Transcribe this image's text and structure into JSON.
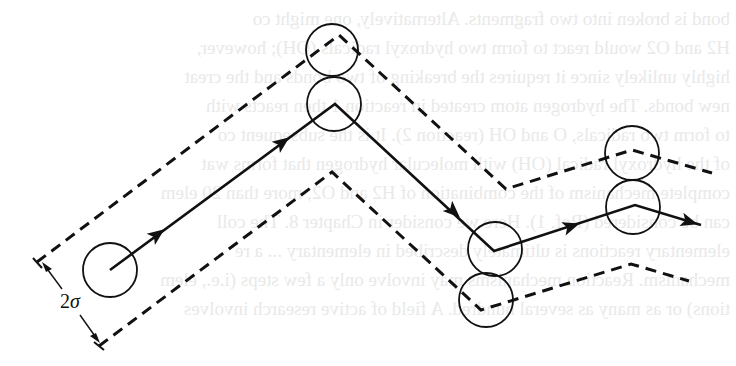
{
  "figure": {
    "dimension_label": {
      "prefix": "2",
      "symbol": "σ"
    },
    "colors": {
      "stroke": "#111111",
      "background": "#ffffff",
      "bleed_text": "#e9e9e9"
    },
    "trajectory": {
      "style": "solid",
      "points": [
        [
          110,
          270
        ],
        [
          335,
          104
        ],
        [
          494,
          251
        ],
        [
          635,
          205
        ],
        [
          701,
          225
        ]
      ],
      "arrowheads": [
        [
          158,
          234
        ],
        [
          283,
          142
        ],
        [
          454,
          212
        ],
        [
          572,
          226
        ],
        [
          690,
          222
        ]
      ]
    },
    "upper_envelope": {
      "style": "dashed",
      "points": [
        [
          37,
          262
        ],
        [
          339,
          35
        ],
        [
          506,
          189
        ],
        [
          632,
          150
        ],
        [
          712,
          173
        ]
      ]
    },
    "lower_envelope": {
      "style": "dashed",
      "points": [
        [
          99,
          346
        ],
        [
          332,
          172
        ],
        [
          481,
          310
        ],
        [
          631,
          264
        ],
        [
          689,
          281
        ]
      ]
    },
    "molecules": [
      {
        "name": "start",
        "cx": 110,
        "cy": 270,
        "r": 27
      },
      {
        "name": "top-upper",
        "cx": 332,
        "cy": 50,
        "r": 26
      },
      {
        "name": "top-lower",
        "cx": 334,
        "cy": 104,
        "r": 27
      },
      {
        "name": "mid-upper",
        "cx": 495,
        "cy": 249,
        "r": 27
      },
      {
        "name": "mid-lower",
        "cx": 486,
        "cy": 300,
        "r": 27
      },
      {
        "name": "right-upper",
        "cx": 632,
        "cy": 153,
        "r": 27
      },
      {
        "name": "right-lower",
        "cx": 633,
        "cy": 207,
        "r": 27
      }
    ]
  },
  "bleed_through_text": [
    "bond is broken into two fragments. Alternatively, one might co",
    "H2 and O2 would react to form two hydroxyl radicals (OH); however,",
    "highly unlikely since it requires the breaking of two bonds and the creat",
    "new bonds. The hydrogen atom created in reaction 1 then reacts with",
    "to form two radicals, O and OH (reaction 2). It is the subsequent co",
    "of the hydroxyl radical (OH) with molecular hydrogen that forms wat",
    "complete mechanism of the combination of H2 and O2, more than 20 elem",
    "can be considered (Ref. 1). Here we consider in Chapter 8. The coll",
    "elementary reactions is ultimately described in elementary ... a re",
    "mechanism. Reaction mechanisms may involve only a few steps (i.e., elem",
    "tions) or as many as several hundred. A field of active research involves"
  ]
}
